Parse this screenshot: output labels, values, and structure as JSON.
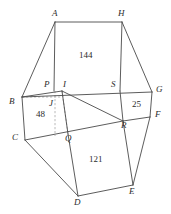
{
  "figure": {
    "type": "geometry-diagram",
    "stroke_color": "#4a4a4a",
    "dashed_color": "#9a9a9a",
    "text_color": "#2b2b2b",
    "background": "#ffffff",
    "width": 171,
    "height": 214,
    "vertices": [
      {
        "name": "A",
        "label": "A",
        "x": 55,
        "y": 22,
        "label_x": 52,
        "label_y": 10
      },
      {
        "name": "H",
        "label": "H",
        "x": 122,
        "y": 22,
        "label_x": 119,
        "label_y": 10
      },
      {
        "name": "B",
        "label": "B",
        "x": 22,
        "y": 97,
        "label_x": 10,
        "label_y": 98
      },
      {
        "name": "G",
        "label": "G",
        "x": 152,
        "y": 92,
        "label_x": 156,
        "label_y": 88
      },
      {
        "name": "C",
        "label": "C",
        "x": 25,
        "y": 140,
        "label_x": 13,
        "label_y": 134
      },
      {
        "name": "F",
        "label": "F",
        "x": 150,
        "y": 117,
        "label_x": 155,
        "label_y": 113
      },
      {
        "name": "D",
        "label": "D",
        "x": 78,
        "y": 196,
        "label_x": 74,
        "label_y": 199
      },
      {
        "name": "E",
        "label": "E",
        "x": 133,
        "y": 185,
        "label_x": 130,
        "label_y": 189
      },
      {
        "name": "P",
        "label": "P",
        "x": 54,
        "y": 91,
        "label_x": 44,
        "label_y": 81
      },
      {
        "name": "I",
        "label": "I",
        "x": 62,
        "y": 91,
        "label_x": 63,
        "label_y": 81
      },
      {
        "name": "S",
        "label": "S",
        "x": 120,
        "y": 91,
        "label_x": 112,
        "label_y": 81
      },
      {
        "name": "J",
        "label": "J",
        "x": 55,
        "y": 102,
        "label_x": 48,
        "label_y": 101
      },
      {
        "name": "Q",
        "label": "Q",
        "x": 68,
        "y": 134,
        "label_x": 66,
        "label_y": 135
      },
      {
        "name": "R",
        "label": "R",
        "x": 123,
        "y": 121,
        "label_x": 122,
        "label_y": 122
      }
    ],
    "area_labels": [
      {
        "name": "area-144",
        "value": "144",
        "x": 87,
        "y": 56
      },
      {
        "name": "area-48",
        "value": "48",
        "x": 41,
        "y": 114
      },
      {
        "name": "area-121",
        "value": "121",
        "x": 96,
        "y": 160
      },
      {
        "name": "area-25",
        "value": "25",
        "x": 137,
        "y": 104
      }
    ],
    "solid_edges": [
      {
        "name": "edge-A-H",
        "from": "A",
        "to": "H"
      },
      {
        "name": "edge-A-B",
        "from": "A",
        "to": "B"
      },
      {
        "name": "edge-H-G",
        "from": "H",
        "to": "G"
      },
      {
        "name": "edge-B-C",
        "from": "B",
        "to": "C"
      },
      {
        "name": "edge-G-F",
        "from": "G",
        "to": "F"
      },
      {
        "name": "edge-C-D",
        "from": "C",
        "to": "D"
      },
      {
        "name": "edge-F-E",
        "from": "F",
        "to": "E"
      },
      {
        "name": "edge-D-E",
        "from": "D",
        "to": "E"
      },
      {
        "name": "edge-A-P",
        "from": "A",
        "to": "P"
      },
      {
        "name": "edge-H-S",
        "from": "H",
        "to": "S"
      },
      {
        "name": "edge-P-G",
        "from": "P",
        "to": "G"
      },
      {
        "name": "edge-B-Q",
        "from": "B",
        "to": "Q"
      },
      {
        "name": "edge-C-R",
        "from": "C",
        "to": "R"
      },
      {
        "name": "edge-Q-D",
        "from": "Q",
        "to": "D"
      },
      {
        "name": "edge-R-E",
        "from": "R",
        "to": "E"
      },
      {
        "name": "edge-I-R",
        "from": "I",
        "to": "R"
      },
      {
        "name": "edge-S-R",
        "from": "S",
        "to": "R"
      },
      {
        "name": "edge-I-Q",
        "from": "I",
        "to": "Q"
      },
      {
        "name": "edge-B-I",
        "from": "B",
        "to": "I"
      }
    ],
    "dashed_edges": [
      {
        "name": "dash-B-J",
        "from": "B",
        "to": "J"
      },
      {
        "name": "dash-J-P",
        "from": "J",
        "to": "P"
      },
      {
        "name": "dash-P-Q",
        "from": "P",
        "to": "Q"
      },
      {
        "name": "dash-I-Qv",
        "from": "I",
        "to": "Q"
      }
    ]
  }
}
